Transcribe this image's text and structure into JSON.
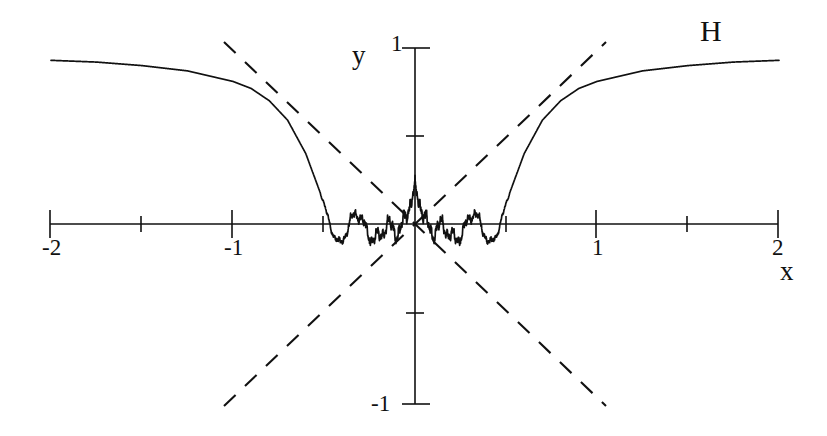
{
  "figure": {
    "width": 827,
    "height": 436,
    "background": "#ffffff",
    "ink_color": "#111111"
  },
  "labels": {
    "x_axis_name": "x",
    "y_axis_name": "y",
    "curve_name": "H"
  },
  "chart_data": {
    "type": "line",
    "title": "",
    "subtitle": "",
    "xlabel": "x",
    "ylabel": "y",
    "xlim": [
      -2,
      2
    ],
    "ylim": [
      -1,
      1
    ],
    "grid": false,
    "legend": "none",
    "annotations": [
      {
        "text": "H",
        "x": 1.58,
        "y": 1.05,
        "note": "curve label, top right"
      }
    ],
    "xticks": [
      -2,
      -1.5,
      -1,
      -0.5,
      0,
      0.5,
      1,
      1.5,
      2
    ],
    "xtick_labels": [
      "-2",
      "",
      "-1",
      "",
      "",
      "",
      "1",
      "",
      "2"
    ],
    "xtick_major": [
      -2,
      -1,
      1,
      2
    ],
    "yticks": [
      -1,
      -0.5,
      0,
      0.5,
      1
    ],
    "ytick_labels": [
      "-1",
      "",
      "",
      "",
      "1"
    ],
    "ytick_major": [
      -1,
      1
    ],
    "series": [
      {
        "name": "H",
        "style": "solid",
        "description": "Weierstrass-type oscillatory function: even, equal to about 0.93 at |x|=2, decreasing to minima near y=-0.22 at x=+/-0.41, with increasingly dense self-similar oscillations toward x=0",
        "key_points": [
          {
            "x": -2.0,
            "y": 0.93
          },
          {
            "x": -1.75,
            "y": 0.92
          },
          {
            "x": -1.5,
            "y": 0.9
          },
          {
            "x": -1.25,
            "y": 0.87
          },
          {
            "x": -1.0,
            "y": 0.81
          },
          {
            "x": -0.9,
            "y": 0.77
          },
          {
            "x": -0.8,
            "y": 0.7
          },
          {
            "x": -0.7,
            "y": 0.59
          },
          {
            "x": -0.6,
            "y": 0.4
          },
          {
            "x": -0.5,
            "y": 0.12
          },
          {
            "x": -0.45,
            "y": -0.1
          },
          {
            "x": -0.41,
            "y": -0.22
          },
          {
            "x": -0.36,
            "y": -0.17
          },
          {
            "x": -0.3,
            "y": 0.03
          },
          {
            "x": -0.25,
            "y": 0.16
          },
          {
            "x": -0.22,
            "y": 0.09
          },
          {
            "x": -0.19,
            "y": -0.06
          },
          {
            "x": -0.16,
            "y": 0.05
          },
          {
            "x": -0.12,
            "y": 0.12
          },
          {
            "x": -0.08,
            "y": -0.05
          },
          {
            "x": -0.05,
            "y": 0.07
          },
          {
            "x": -0.02,
            "y": -0.03
          },
          {
            "x": 0.0,
            "y": 0.0
          },
          {
            "x": 0.02,
            "y": -0.03
          },
          {
            "x": 0.05,
            "y": 0.07
          },
          {
            "x": 0.08,
            "y": -0.05
          },
          {
            "x": 0.12,
            "y": 0.12
          },
          {
            "x": 0.16,
            "y": 0.05
          },
          {
            "x": 0.19,
            "y": -0.06
          },
          {
            "x": 0.22,
            "y": 0.09
          },
          {
            "x": 0.25,
            "y": 0.16
          },
          {
            "x": 0.3,
            "y": 0.03
          },
          {
            "x": 0.36,
            "y": -0.17
          },
          {
            "x": 0.41,
            "y": -0.22
          },
          {
            "x": 0.45,
            "y": -0.1
          },
          {
            "x": 0.5,
            "y": 0.12
          },
          {
            "x": 0.6,
            "y": 0.4
          },
          {
            "x": 0.7,
            "y": 0.59
          },
          {
            "x": 0.8,
            "y": 0.7
          },
          {
            "x": 0.9,
            "y": 0.77
          },
          {
            "x": 1.0,
            "y": 0.81
          },
          {
            "x": 1.25,
            "y": 0.87
          },
          {
            "x": 1.5,
            "y": 0.9
          },
          {
            "x": 1.75,
            "y": 0.92
          },
          {
            "x": 2.0,
            "y": 0.93
          }
        ]
      },
      {
        "name": "envelope-positive-slope",
        "style": "dashed",
        "description": "straight dashed line through origin with positive slope, drawn from (-1.05,-1.0) to (1.05,1.0)",
        "points": [
          {
            "x": -1.05,
            "y": -1.0
          },
          {
            "x": 1.05,
            "y": 1.0
          }
        ]
      },
      {
        "name": "envelope-negative-slope",
        "style": "dashed",
        "description": "straight dashed line through origin with negative slope, drawn from (-1.05,1.0) to (1.05,-1.0)",
        "points": [
          {
            "x": -1.05,
            "y": 1.0
          },
          {
            "x": 1.05,
            "y": -1.0
          }
        ]
      }
    ]
  }
}
